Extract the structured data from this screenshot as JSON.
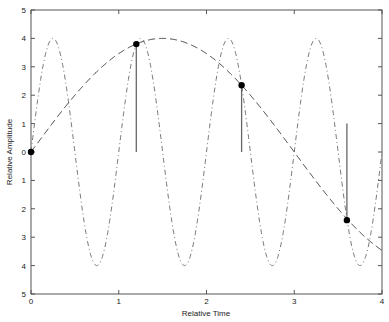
{
  "chart_data": {
    "type": "line",
    "title": "",
    "xlabel": "Relative Time",
    "ylabel": "Relative Amplitude",
    "xlim": [
      0,
      4
    ],
    "ylim": [
      -5,
      5
    ],
    "x_ticks": [
      "0",
      "1",
      "2",
      "3",
      "4"
    ],
    "y_ticks": [
      "5",
      "4",
      "3",
      "2",
      "1",
      "0",
      "1",
      "2",
      "3",
      "4",
      "5"
    ],
    "grid": false,
    "legend": null,
    "series": [
      {
        "name": "high-frequency signal",
        "style": "dash-dot",
        "function": "4*sin(2*pi*t)",
        "amplitude": 4,
        "period": 1
      },
      {
        "name": "aliased signal",
        "style": "dashed",
        "function": "4*sin(2*pi*t/6)",
        "amplitude": 4,
        "period": 6
      },
      {
        "name": "samples",
        "style": "stem-marker",
        "x": [
          0,
          1.2,
          2.4,
          3.6
        ],
        "y": [
          0,
          3.8,
          2.35,
          -2.4
        ]
      }
    ]
  }
}
